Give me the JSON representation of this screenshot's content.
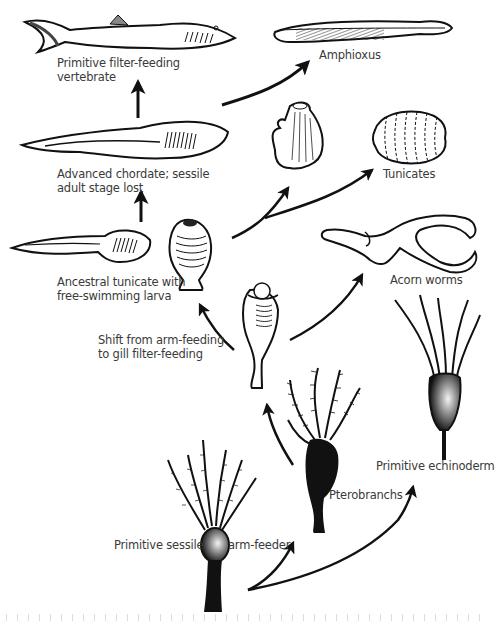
{
  "diagram": {
    "type": "evolutionary-pathway",
    "colors": {
      "ink": "#111111",
      "label": "#3a3a3a",
      "background": "#ffffff"
    },
    "nodes": [
      {
        "id": "primitive-filter-feeding-vertebrate",
        "lines": [
          "Primitive filter-feeding",
          "vertebrate"
        ]
      },
      {
        "id": "amphioxus",
        "lines": [
          "Amphioxus"
        ]
      },
      {
        "id": "advanced-chordate",
        "lines": [
          "Advanced chordate; sessile",
          "adult stage lost"
        ]
      },
      {
        "id": "tunicates",
        "lines": [
          "Tunicates"
        ]
      },
      {
        "id": "ancestral-tunicate",
        "lines": [
          "Ancestral tunicate with",
          "free-swimming larva"
        ]
      },
      {
        "id": "acorn-worms",
        "lines": [
          "Acorn worms"
        ]
      },
      {
        "id": "shift-arm-to-gill",
        "lines": [
          "Shift from arm-feeding",
          "to gill filter-feeding"
        ]
      },
      {
        "id": "primitive-echinoderm",
        "lines": [
          "Primitive echinoderm"
        ]
      },
      {
        "id": "pterobranchs",
        "lines": [
          "Pterobranchs"
        ]
      },
      {
        "id": "primitive-sessile-arm-feeder",
        "lines": [
          "Primitive sessile",
          "arm-feeder"
        ]
      }
    ],
    "edges": [
      {
        "from": "primitive-sessile-arm-feeder",
        "to": "pterobranchs"
      },
      {
        "from": "primitive-sessile-arm-feeder",
        "to": "primitive-echinoderm"
      },
      {
        "from": "pterobranchs",
        "to": "shift-arm-to-gill"
      },
      {
        "from": "shift-arm-to-gill",
        "to": "ancestral-tunicate"
      },
      {
        "from": "shift-arm-to-gill",
        "to": "acorn-worms"
      },
      {
        "from": "ancestral-tunicate",
        "to": "advanced-chordate"
      },
      {
        "from": "ancestral-tunicate",
        "to": "tunicates"
      },
      {
        "from": "advanced-chordate",
        "to": "primitive-filter-feeding-vertebrate"
      },
      {
        "from": "advanced-chordate",
        "to": "amphioxus"
      }
    ],
    "footer_caption_cut_off": true
  }
}
